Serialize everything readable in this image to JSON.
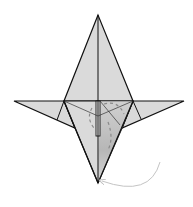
{
  "diagram": {
    "type": "origami-fold-step",
    "colors": {
      "paper": "#d9d9d9",
      "paper_shadow": "#a8a8a8",
      "line": "#111111",
      "dashed_line": "#888888",
      "arrow": "#c8c8c8",
      "background": "#ffffff"
    },
    "elements": [
      {
        "name": "top-point",
        "label": ""
      },
      {
        "name": "left-wing",
        "label": ""
      },
      {
        "name": "right-wing",
        "label": ""
      },
      {
        "name": "bottom-point",
        "label": ""
      },
      {
        "name": "fold-arrow",
        "label": ""
      }
    ]
  }
}
